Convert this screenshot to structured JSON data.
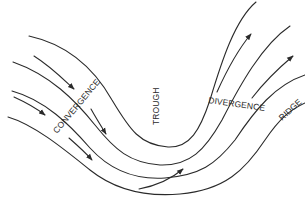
{
  "diagram": {
    "type": "flow-streamlines",
    "labels": {
      "convergence": "CONVERGENCE",
      "trough": "TROUGH",
      "divergence": "DIVERGENCE",
      "ridge": "RIDGE"
    },
    "line_color": "#2a2a2a",
    "background": "#ffffff"
  }
}
